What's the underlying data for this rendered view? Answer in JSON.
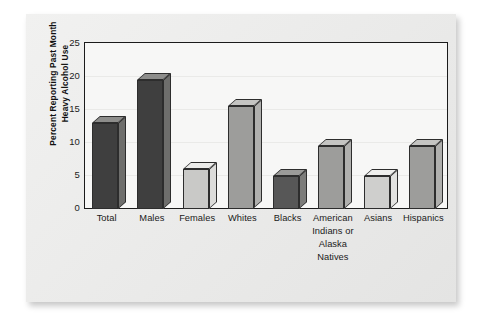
{
  "chart_data": {
    "type": "bar",
    "title": "",
    "subtitle": "",
    "xlabel": "",
    "ylabel": "Percent Reporting Past Month Heavy Alcohol Use",
    "ylabel_lines": [
      "Percent Reporting Past Month",
      "Heavy Alcohol Use"
    ],
    "ylim": [
      0,
      25
    ],
    "ytick_labels": [
      "0",
      "5",
      "10",
      "15",
      "20",
      "25"
    ],
    "ytick_values": [
      0,
      5,
      10,
      15,
      20,
      25
    ],
    "grid": true,
    "grid_axis": "y",
    "legend": null,
    "legend_position": "none",
    "categories": [
      "Total",
      "Males",
      "Females",
      "Whites",
      "Blacks",
      "American Indians or Alaska Natives",
      "Asians",
      "Hispanics"
    ],
    "category_label_lines": [
      [
        "Total"
      ],
      [
        "Males"
      ],
      [
        "Females"
      ],
      [
        "Whites"
      ],
      [
        "Blacks"
      ],
      [
        "American",
        "Indians or",
        "Alaska",
        "Natives"
      ],
      [
        "Asians"
      ],
      [
        "Hispanics"
      ]
    ],
    "values": [
      13,
      19.5,
      6,
      15.5,
      5,
      9.5,
      5,
      9.5
    ],
    "bar_colors": [
      "#3f3f3f",
      "#3f3f3f",
      "#c9c9c7",
      "#9d9d9b",
      "#575757",
      "#9d9d9b",
      "#cfcfcd",
      "#9d9d9b"
    ],
    "bar_top_colors": [
      "#8d8d8b",
      "#8d8d8b",
      "#ececea",
      "#c4c4c2",
      "#9b9b99",
      "#c4c4c2",
      "#efefed",
      "#c4c4c2"
    ],
    "bar_side_colors": [
      "#6e6e6c",
      "#6e6e6c",
      "#dcdcda",
      "#b0b0ae",
      "#7c7c7a",
      "#b0b0ae",
      "#e2e2e0",
      "#b0b0ae"
    ],
    "style": "3d-extruded-bars",
    "plot_background": "#f7f7f6",
    "page_background": "#ececeb",
    "axis_color": "#1b1b1b"
  }
}
